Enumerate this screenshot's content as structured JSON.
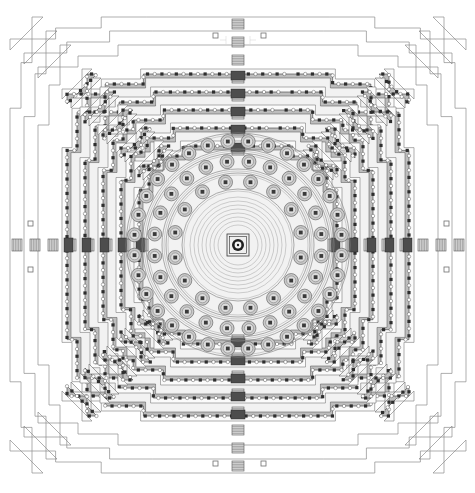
{
  "document": {
    "type": "architectural-ground-plan",
    "subject": "Concentric stepped mandala temple ground plan",
    "orientation": "plan view, north at top",
    "background_color": "#ffffff",
    "ink_color": "#3a3a3a",
    "wall_fill_color": "#bdbdbd",
    "hairline_color": "#8d8d8d"
  },
  "canvas": {
    "width": 475,
    "height": 493,
    "center_x": 238,
    "center_y": 245
  },
  "outer_boundary": {
    "name": "stepped outer precinct walls",
    "line_count": 3,
    "style": "thin single hairlines, redented / stepped square outline",
    "steps_per_side": 7,
    "half_extents": [
      228,
      214,
      200
    ]
  },
  "square_terraces": {
    "count": 5,
    "description": "five redented square galleries with balustrade niche bands",
    "half_extents": [
      176,
      158,
      140,
      122,
      104
    ],
    "niche_band": {
      "pattern": "alternating square niche and round medallion",
      "fill": "#bdbdbd",
      "outline": "#4a4a4a"
    }
  },
  "circular_terraces": {
    "count": 3,
    "description": "three circular terraces bearing perforated bell stupas",
    "radii": [
      104,
      84,
      64
    ],
    "stupa_counts": [
      32,
      24,
      16
    ],
    "stupa_total": 72,
    "stupa": {
      "outer_fill": "#c9c9c9",
      "inner_fill": "#dedede",
      "core_fill": "#3a3a3a",
      "radius": 7
    }
  },
  "central_stupa": {
    "name": "main crowning stupa",
    "shape": "square platform with circular stupa",
    "platform_half_size": 11,
    "ring_radius": 6,
    "concentric_rings": 8,
    "ring_radii": [
      20,
      24,
      28,
      32,
      36,
      40,
      44,
      48
    ]
  },
  "stairways": {
    "count": 4,
    "directions": [
      "north",
      "east",
      "south",
      "west"
    ],
    "tread_count": 6,
    "description": "axial stairways on each cardinal side with gate blocks"
  },
  "corner_markers": {
    "count": 8,
    "description": "small open squares marking survey points on the four axes",
    "size": 5
  },
  "legend": {
    "note": "no printed text labels present in drawing"
  }
}
